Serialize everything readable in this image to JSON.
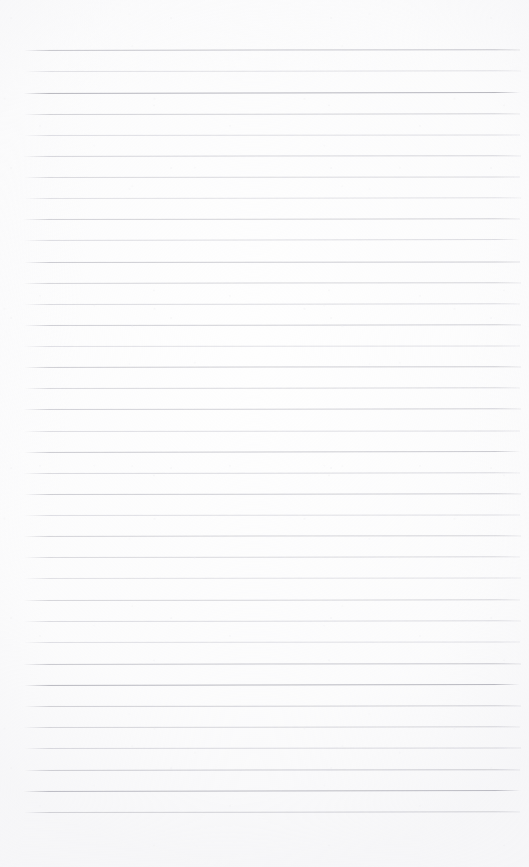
{
  "page": {
    "kind": "lined-notebook-paper",
    "state": "blank",
    "text_content": "",
    "width_px": 529,
    "height_px": 867,
    "background_color": "#fefefe"
  },
  "ruling": {
    "line_color": "#d9d9de",
    "line_color_dark": "#b9b9c0",
    "line_color_faint": "#eaeaee",
    "line_count": 36,
    "line_spacing_px": 21.1,
    "first_line_y_px": 50,
    "last_line_y_px": 812,
    "line_start_x_px": 23,
    "line_end_x_px": 520,
    "line_thickness_px": 1,
    "margin_rule": "none",
    "lines": [
      {
        "y": 50,
        "x1": 24,
        "x2": 520,
        "tone": 0.78,
        "tilt": -0.1
      },
      {
        "y": 71,
        "x1": 25,
        "x2": 521,
        "tone": 0.34,
        "tilt": -0.08
      },
      {
        "y": 93,
        "x1": 23,
        "x2": 521,
        "tone": 1.0,
        "tilt": -0.12
      },
      {
        "y": 114,
        "x1": 24,
        "x2": 520,
        "tone": 0.6,
        "tilt": -0.09
      },
      {
        "y": 135,
        "x1": 24,
        "x2": 520,
        "tone": 0.4,
        "tilt": -0.07
      },
      {
        "y": 156,
        "x1": 23,
        "x2": 521,
        "tone": 0.55,
        "tilt": -0.1
      },
      {
        "y": 177,
        "x1": 24,
        "x2": 520,
        "tone": 0.5,
        "tilt": -0.06
      },
      {
        "y": 198,
        "x1": 24,
        "x2": 521,
        "tone": 0.36,
        "tilt": -0.09
      },
      {
        "y": 219,
        "x1": 23,
        "x2": 520,
        "tone": 0.62,
        "tilt": -0.08
      },
      {
        "y": 240,
        "x1": 24,
        "x2": 521,
        "tone": 0.44,
        "tilt": -0.11
      },
      {
        "y": 262,
        "x1": 24,
        "x2": 520,
        "tone": 0.72,
        "tilt": -0.07
      },
      {
        "y": 283,
        "x1": 23,
        "x2": 521,
        "tone": 0.58,
        "tilt": -0.1
      },
      {
        "y": 304,
        "x1": 24,
        "x2": 520,
        "tone": 0.46,
        "tilt": -0.08
      },
      {
        "y": 325,
        "x1": 24,
        "x2": 521,
        "tone": 0.66,
        "tilt": -0.09
      },
      {
        "y": 346,
        "x1": 23,
        "x2": 520,
        "tone": 0.38,
        "tilt": -0.06
      },
      {
        "y": 367,
        "x1": 24,
        "x2": 521,
        "tone": 0.7,
        "tilt": -0.1
      },
      {
        "y": 388,
        "x1": 24,
        "x2": 520,
        "tone": 0.52,
        "tilt": -0.08
      },
      {
        "y": 409,
        "x1": 23,
        "x2": 521,
        "tone": 0.64,
        "tilt": -0.09
      },
      {
        "y": 431,
        "x1": 24,
        "x2": 520,
        "tone": 0.42,
        "tilt": -0.07
      },
      {
        "y": 452,
        "x1": 24,
        "x2": 521,
        "tone": 0.74,
        "tilt": -0.11
      },
      {
        "y": 473,
        "x1": 23,
        "x2": 520,
        "tone": 0.48,
        "tilt": -0.08
      },
      {
        "y": 494,
        "x1": 24,
        "x2": 521,
        "tone": 0.68,
        "tilt": -0.09
      },
      {
        "y": 515,
        "x1": 24,
        "x2": 520,
        "tone": 0.4,
        "tilt": -0.07
      },
      {
        "y": 536,
        "x1": 23,
        "x2": 521,
        "tone": 0.6,
        "tilt": -0.1
      },
      {
        "y": 557,
        "x1": 24,
        "x2": 520,
        "tone": 0.5,
        "tilt": -0.08
      },
      {
        "y": 578,
        "x1": 24,
        "x2": 521,
        "tone": 0.36,
        "tilt": -0.06
      },
      {
        "y": 600,
        "x1": 23,
        "x2": 520,
        "tone": 0.56,
        "tilt": -0.09
      },
      {
        "y": 621,
        "x1": 24,
        "x2": 521,
        "tone": 0.44,
        "tilt": -0.08
      },
      {
        "y": 642,
        "x1": 24,
        "x2": 520,
        "tone": 0.38,
        "tilt": -0.07
      },
      {
        "y": 664,
        "x1": 23,
        "x2": 521,
        "tone": 0.76,
        "tilt": -0.1
      },
      {
        "y": 685,
        "x1": 24,
        "x2": 520,
        "tone": 0.95,
        "tilt": -0.12
      },
      {
        "y": 706,
        "x1": 24,
        "x2": 521,
        "tone": 0.62,
        "tilt": -0.08
      },
      {
        "y": 727,
        "x1": 23,
        "x2": 520,
        "tone": 0.54,
        "tilt": -0.09
      },
      {
        "y": 748,
        "x1": 24,
        "x2": 521,
        "tone": 0.46,
        "tilt": -0.07
      },
      {
        "y": 770,
        "x1": 24,
        "x2": 520,
        "tone": 0.66,
        "tilt": -0.1
      },
      {
        "y": 791,
        "x1": 23,
        "x2": 521,
        "tone": 0.9,
        "tilt": -0.11
      },
      {
        "y": 812,
        "x1": 24,
        "x2": 520,
        "tone": 0.58,
        "tilt": -0.09
      }
    ]
  }
}
